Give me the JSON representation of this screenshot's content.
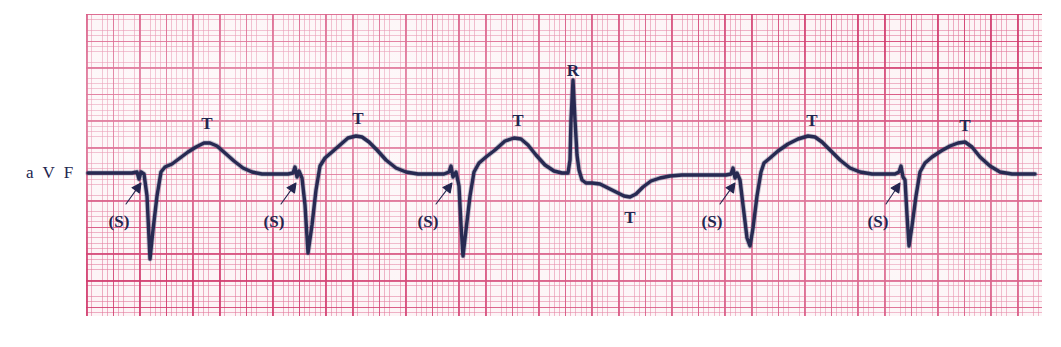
{
  "strip": {
    "lead_label": "a V F",
    "paper": {
      "bg_color": "#fdf4f6",
      "fine_grid_color": "#e2789b",
      "bold_grid_color": "#d13a6d",
      "small_box_px": 5.32,
      "large_box_px": 26.6,
      "left": 86,
      "top": 14,
      "width": 956,
      "height": 302
    },
    "trace": {
      "color": "#272a52",
      "stroke_width": 3.4,
      "baseline_y": 174
    }
  },
  "annotations": [
    {
      "id": "s-1",
      "text": "(S)",
      "x": 119,
      "y": 213,
      "arrow_from": [
        126,
        204
      ],
      "arrow_to": [
        141,
        183
      ]
    },
    {
      "id": "t-1",
      "text": "T",
      "x": 207,
      "y": 115
    },
    {
      "id": "s-2",
      "text": "(S)",
      "x": 274,
      "y": 213,
      "arrow_from": [
        281,
        204
      ],
      "arrow_to": [
        296,
        183
      ]
    },
    {
      "id": "t-2",
      "text": "T",
      "x": 358,
      "y": 110
    },
    {
      "id": "s-3",
      "text": "(S)",
      "x": 428,
      "y": 213,
      "arrow_from": [
        436,
        204
      ],
      "arrow_to": [
        452,
        183
      ]
    },
    {
      "id": "t-3",
      "text": "T",
      "x": 518,
      "y": 112
    },
    {
      "id": "r-1",
      "text": "R",
      "x": 573,
      "y": 62
    },
    {
      "id": "t-4",
      "text": "T",
      "x": 630,
      "y": 209
    },
    {
      "id": "s-4",
      "text": "(S)",
      "x": 712,
      "y": 213,
      "arrow_from": [
        720,
        204
      ],
      "arrow_to": [
        735,
        183
      ]
    },
    {
      "id": "t-5",
      "text": "T",
      "x": 812,
      "y": 112
    },
    {
      "id": "s-5",
      "text": "(S)",
      "x": 878,
      "y": 213,
      "arrow_from": [
        886,
        204
      ],
      "arrow_to": [
        900,
        183
      ]
    },
    {
      "id": "t-6",
      "text": "T",
      "x": 965,
      "y": 117
    }
  ],
  "chart_data": {
    "type": "line",
    "title": "",
    "xlabel": "",
    "ylabel": "",
    "lead": "aVF",
    "grid": true,
    "baseline_y_px": 174,
    "beats": [
      {
        "index": 1,
        "type": "QS",
        "s_notch_x": 141,
        "qs_nadir_x": 150,
        "qs_nadir_y": 259,
        "t_peak_x": 208,
        "t_peak_y": 143,
        "t_polarity": "upright"
      },
      {
        "index": 2,
        "type": "QS",
        "s_notch_x": 296,
        "qs_nadir_x": 308,
        "qs_nadir_y": 253,
        "t_peak_x": 358,
        "t_peak_y": 136,
        "t_polarity": "upright"
      },
      {
        "index": 3,
        "type": "QS",
        "s_notch_x": 452,
        "qs_nadir_x": 462,
        "qs_nadir_y": 256,
        "t_peak_x": 518,
        "t_peak_y": 138,
        "t_polarity": "upright"
      },
      {
        "index": 4,
        "type": "R",
        "r_peak_x": 573,
        "r_peak_y": 80,
        "t_peak_x": 630,
        "t_peak_y": 197,
        "t_polarity": "inverted"
      },
      {
        "index": 5,
        "type": "QS",
        "s_notch_x": 735,
        "qs_nadir_x": 750,
        "qs_nadir_y": 246,
        "t_peak_x": 812,
        "t_peak_y": 136,
        "t_polarity": "upright"
      },
      {
        "index": 6,
        "type": "QS",
        "s_notch_x": 900,
        "qs_nadir_x": 909,
        "qs_nadir_y": 246,
        "t_peak_x": 965,
        "t_peak_y": 142,
        "t_polarity": "upright"
      }
    ],
    "trace_path": "M 88,173 L 132,173 L 137,172 L 139,179 L 141,172 L 144,174 L 147,196 L 150,259 L 153,230 L 157,196 L 161,172 L 165,167 L 172,164 L 180,158 L 188,152 L 196,147 L 204,143 L 210,143 L 217,146 L 225,153 L 234,161 L 243,168 L 252,172 L 262,174 L 275,174 L 288,174 L 293,173 L 295,167 L 297,177 L 299,171 L 302,178 L 305,205 L 308,253 L 312,225 L 316,190 L 320,166 L 325,158 L 332,152 L 340,145 L 348,138 L 356,136 L 362,137 L 369,142 L 377,150 L 386,160 L 396,168 L 406,172 L 418,174 L 432,174 L 444,174 L 449,172 L 451,166 L 453,177 L 456,172 L 459,186 L 461,225 L 463,256 L 466,230 L 470,196 L 474,172 L 479,163 L 486,157 L 495,150 L 505,141 L 514,138 L 521,139 L 528,145 L 536,155 L 545,165 L 554,171 L 562,173 L 568,173 L 570,160 L 571,120 L 573,80 L 575,120 L 577,155 L 579,170 L 582,180 L 586,183 L 592,183 L 600,184 L 608,188 L 616,192 L 624,196 L 630,197 L 636,194 L 643,187 L 651,181 L 660,178 L 670,176 L 682,175 L 696,175 L 712,175 L 726,175 L 731,174 L 733,168 L 735,178 L 737,173 L 740,180 L 743,205 L 747,238 L 750,246 L 753,228 L 757,196 L 761,172 L 764,163 L 770,158 L 778,151 L 788,144 L 798,139 L 808,136 L 815,137 L 822,142 L 830,150 L 840,160 L 850,168 L 860,172 L 872,174 L 884,174 L 895,174 L 899,172 L 901,166 L 903,177 L 905,180 L 907,215 L 909,246 L 912,226 L 916,196 L 920,172 L 925,163 L 932,157 L 941,151 L 950,146 L 958,143 L 965,142 L 972,147 L 980,157 L 990,166 L 1000,172 L 1012,174 L 1024,174 L 1035,174"
  }
}
